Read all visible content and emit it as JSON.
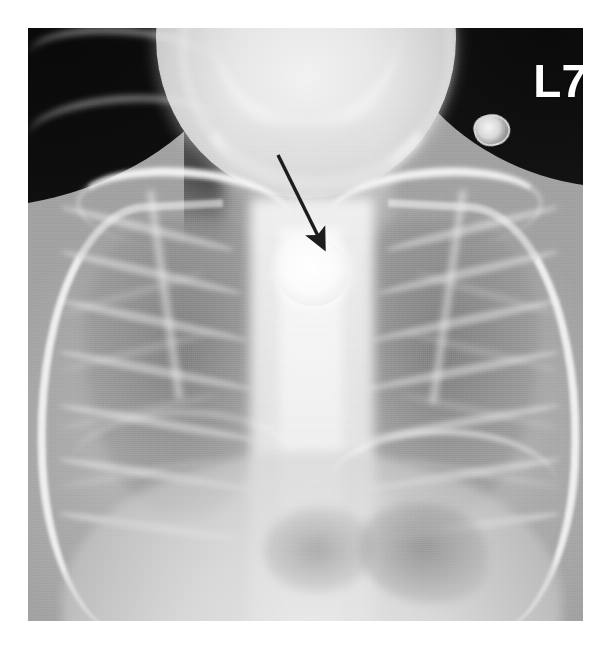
{
  "image": {
    "kind": "radiograph",
    "modality": "plain-film-chest-xray",
    "view": "frontal-ap",
    "subject": "pediatric-chest",
    "background_color": "#ffffff",
    "plate_color": "#9a9a9a"
  },
  "annotations": {
    "side_marker": {
      "label": "L7",
      "color": "#ffffff",
      "position": "top-right"
    },
    "arrow": {
      "name": "pointer-arrow",
      "color": "#1c1c1c",
      "tail_x": 278,
      "tail_y": 155,
      "head_x": 320,
      "head_y": 240,
      "direction": "down-right"
    }
  },
  "findings": [
    {
      "name": "radiopaque-foreign-body",
      "description": "round radiodense foreign body overlying the upper mediastinum / proximal esophagus",
      "shape": "circular",
      "brightness": "very-high",
      "center_x": 313,
      "center_y": 272,
      "diameter_px": 72
    },
    {
      "name": "metallic-clip-artifact",
      "description": "small external metallic snap projected over the soft tissues of the left neck",
      "shape": "oval",
      "center_x": 490,
      "center_y": 128,
      "width_px": 32
    }
  ],
  "anatomy": [
    {
      "name": "skull-mandible",
      "region": "superior-midline",
      "density": "bright"
    },
    {
      "name": "neck-soft-tissue",
      "region": "superior-midline",
      "density": "mid"
    },
    {
      "name": "air-background-right",
      "region": "top-left-corner",
      "density": "dark"
    },
    {
      "name": "air-background-left",
      "region": "top-right-corner",
      "density": "dark"
    },
    {
      "name": "clavicle-right",
      "region": "upper-left",
      "density": "bright"
    },
    {
      "name": "clavicle-left",
      "region": "upper-right",
      "density": "bright"
    },
    {
      "name": "scapula-right",
      "region": "upper-left-lateral",
      "density": "bright"
    },
    {
      "name": "scapula-left",
      "region": "upper-right-lateral",
      "density": "bright"
    },
    {
      "name": "rib-cage-right",
      "region": "left-hemithorax-of-image",
      "density": "bright-lines"
    },
    {
      "name": "rib-cage-left",
      "region": "right-hemithorax-of-image",
      "density": "bright-lines"
    },
    {
      "name": "lung-field-right",
      "region": "mid-left-of-image",
      "density": "lucent"
    },
    {
      "name": "lung-field-left",
      "region": "mid-right-of-image",
      "density": "lucent"
    },
    {
      "name": "mediastinum-spine",
      "region": "central-column",
      "density": "bright"
    },
    {
      "name": "diaphragm",
      "region": "inferior",
      "density": "bright"
    },
    {
      "name": "gastric-bubble",
      "region": "inferior-right-of-image",
      "density": "lucent"
    },
    {
      "name": "bowel-gas",
      "region": "inferior-central",
      "density": "lucent"
    }
  ],
  "ribs": {
    "right_side": [
      {
        "top": 196,
        "width": 178,
        "rotate": 14
      },
      {
        "top": 240,
        "width": 186,
        "rotate": 13
      },
      {
        "top": 288,
        "width": 192,
        "rotate": 12
      },
      {
        "top": 338,
        "width": 196,
        "rotate": 11
      },
      {
        "top": 390,
        "width": 198,
        "rotate": 10
      },
      {
        "top": 442,
        "width": 196,
        "rotate": 9
      },
      {
        "top": 494,
        "width": 184,
        "rotate": 8
      }
    ],
    "left_side": [
      {
        "top": 196,
        "width": 178,
        "rotate": -14
      },
      {
        "top": 240,
        "width": 186,
        "rotate": -13
      },
      {
        "top": 288,
        "width": 192,
        "rotate": -12
      },
      {
        "top": 338,
        "width": 196,
        "rotate": -11
      },
      {
        "top": 390,
        "width": 198,
        "rotate": -10
      },
      {
        "top": 442,
        "width": 196,
        "rotate": -9
      },
      {
        "top": 494,
        "width": 184,
        "rotate": -8
      }
    ]
  },
  "anterior_ribs": {
    "right_side": [
      {
        "top": 262,
        "width": 150,
        "rotate": -16
      },
      {
        "top": 320,
        "width": 158,
        "rotate": -14
      },
      {
        "top": 380,
        "width": 162,
        "rotate": -12
      },
      {
        "top": 442,
        "width": 158,
        "rotate": -10
      }
    ],
    "left_side": [
      {
        "top": 262,
        "width": 150,
        "rotate": 16
      },
      {
        "top": 320,
        "width": 158,
        "rotate": 14
      },
      {
        "top": 380,
        "width": 162,
        "rotate": 12
      },
      {
        "top": 442,
        "width": 158,
        "rotate": 10
      }
    ]
  }
}
